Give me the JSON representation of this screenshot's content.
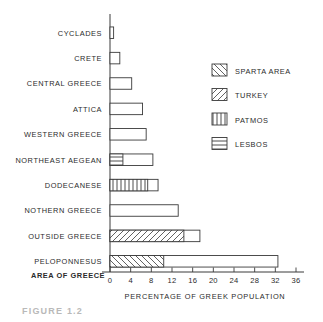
{
  "figure": {
    "caption": "FIGURE 1.2"
  },
  "chart_data": {
    "type": "bar",
    "orientation": "horizontal",
    "title": "",
    "xlabel": "PERCENTAGE OF GREEK POPULATION",
    "ylabel": "AREA OF GREECE",
    "xlim": [
      0,
      36
    ],
    "xticks": [
      0,
      4,
      8,
      12,
      16,
      20,
      24,
      28,
      32,
      36
    ],
    "xtick_labels": [
      "0",
      "4",
      "8",
      "12",
      "16",
      "20",
      "24",
      "28",
      "32",
      "36"
    ],
    "grid": false,
    "legend_position": "upper right",
    "legend": [
      {
        "name": "SPARTA AREA",
        "pattern": "diagonal-backslash"
      },
      {
        "name": "TURKEY",
        "pattern": "diagonal-forward"
      },
      {
        "name": "PATMOS",
        "pattern": "vertical-lines"
      },
      {
        "name": "LESBOS",
        "pattern": "horizontal-lines"
      }
    ],
    "categories": [
      "CYCLADES",
      "CRETE",
      "CENTRAL GREECE",
      "ATTICA",
      "WESTERN GREECE",
      "NORTHEAST AEGEAN",
      "DODECANESE",
      "NOTHERN GREECE",
      "OUTSIDE GREECE",
      "PELOPONNESUS"
    ],
    "bars": [
      {
        "category": "CYCLADES",
        "total": 0.7,
        "segment": null,
        "segment_value": 0
      },
      {
        "category": "CRETE",
        "total": 1.9,
        "segment": null,
        "segment_value": 0
      },
      {
        "category": "CENTRAL GREECE",
        "total": 4.2,
        "segment": null,
        "segment_value": 0
      },
      {
        "category": "ATTICA",
        "total": 6.3,
        "segment": null,
        "segment_value": 0
      },
      {
        "category": "WESTERN GREECE",
        "total": 7.0,
        "segment": null,
        "segment_value": 0
      },
      {
        "category": "NORTHEAST AEGEAN",
        "total": 8.3,
        "segment": "LESBOS",
        "segment_value": 2.5
      },
      {
        "category": "DODECANESE",
        "total": 9.3,
        "segment": "PATMOS",
        "segment_value": 7.3
      },
      {
        "category": "NOTHERN GREECE",
        "total": 13.2,
        "segment": null,
        "segment_value": 0
      },
      {
        "category": "OUTSIDE GREECE",
        "total": 17.4,
        "segment": "TURKEY",
        "segment_value": 14.3
      },
      {
        "category": "PELOPONNESUS",
        "total": 32.5,
        "segment": "SPARTA AREA",
        "segment_value": 10.4
      }
    ]
  },
  "colors": {
    "ink": "#3a3a3a",
    "bar_fill": "#ffffff",
    "background": "#ffffff",
    "caption": "#b9b9b9"
  }
}
